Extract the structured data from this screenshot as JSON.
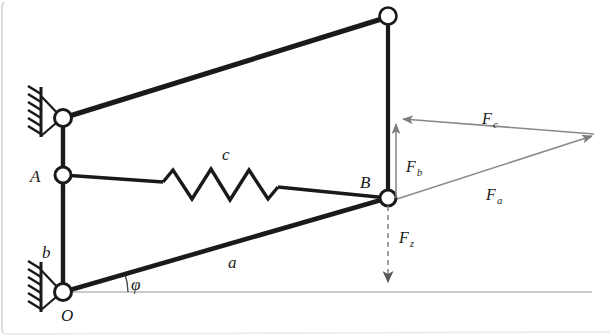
{
  "figure": {
    "background_color": "#ffffff",
    "ink_color": "#1a1a1a",
    "vector_color": "#8a8a8a",
    "frame_edge_color": "#d8d8d8",
    "labels": {
      "joint_a": "A",
      "joint_b": "B",
      "joint_o": "O",
      "link_a": "a",
      "link_b": "b",
      "spring_c": "c",
      "angle_phi": "φ",
      "force_a": "F",
      "force_a_sub": "a",
      "force_b": "F",
      "force_b_sub": "b",
      "force_c": "F",
      "force_c_sub": "c",
      "force_z": "F",
      "force_z_sub": "z"
    },
    "geometry": {
      "pivot_top_left": [
        63,
        118
      ],
      "pivot_bottom_left": [
        63,
        292
      ],
      "joint_a": [
        63,
        175
      ],
      "joint_b": [
        388,
        198
      ],
      "joint_top_right": [
        388,
        16
      ],
      "force_triangle_apex_left_top": [
        400,
        120
      ],
      "force_triangle_apex_right": [
        594,
        135
      ],
      "force_z_tip": [
        390,
        290
      ],
      "angle_phi_degrees": 16
    }
  }
}
